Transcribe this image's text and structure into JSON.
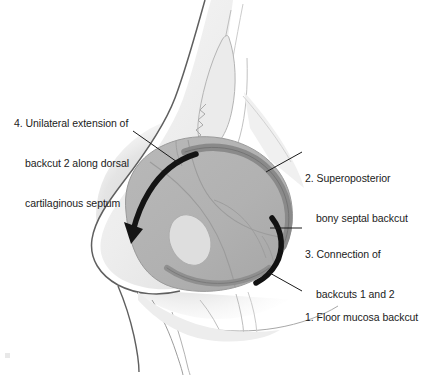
{
  "figure": {
    "background_color": "#ffffff",
    "text_color": "#1b1b1b",
    "leader_line_color": "#1a1a1a"
  },
  "palette": {
    "septum_body": "#b2b2b2",
    "septum_body_dark": "#a2a2a2",
    "skin_light": "#e9e9e9",
    "skin_mid": "#d6d6d6",
    "bone_light": "#f1f1f1",
    "outline": "#6f6f6f",
    "outline_dark": "#3d3d3d",
    "arc_backcut2": "#8a8a8a",
    "arc_floor_mucosa": "#8f8f8f",
    "arc_connection": "#121212",
    "arrow_extension": "#141414",
    "oval_light": "#dddddd",
    "shadow": "#cfcfcf"
  },
  "callouts": [
    {
      "id": "callout-1",
      "number": "1.",
      "lines": [
        "1. Floor mucosa backcut"
      ],
      "label": "Floor mucosa backcut",
      "leader_from": [
        302,
        291
      ],
      "leader_to": [
        268,
        272
      ]
    },
    {
      "id": "callout-2",
      "number": "2.",
      "lines": [
        "2. Superoposterior",
        "bony septal backcut"
      ],
      "label": "Superoposterior bony septal backcut",
      "leader_from": [
        302,
        152
      ],
      "leader_to": [
        266,
        172
      ]
    },
    {
      "id": "callout-3",
      "number": "3.",
      "lines": [
        "3. Connection of",
        "backcuts 1 and 2"
      ],
      "label": "Connection of backcuts 1 and 2",
      "leader_from": [
        302,
        228
      ],
      "leader_to": [
        272,
        228
      ]
    },
    {
      "id": "callout-4",
      "number": "4.",
      "lines": [
        "4. Unilateral extension of",
        "backcut 2 along dorsal",
        "cartilaginous septum"
      ],
      "label": "Unilateral extension of backcut 2 along dorsal cartilaginous septum",
      "leader_from": [
        133,
        131
      ],
      "leader_to": [
        177,
        162
      ]
    }
  ],
  "structures": {
    "septum": "nasal-septum-body",
    "arrow_4": "curved-extension-arrow",
    "arc_2": "superoposterior-bony-septal-backcut-arc",
    "arc_3": "connection-backcut-arc",
    "arc_1": "floor-mucosa-backcut-arc",
    "oval": "perpendicular-plate-oval"
  }
}
